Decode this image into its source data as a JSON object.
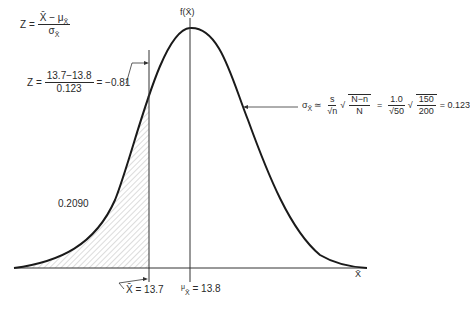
{
  "figure": {
    "type": "normal-distribution-diagram",
    "y_axis_label": "f(X̄)",
    "x_axis_label": "X̄",
    "shaded_area_value": "0.2090",
    "colors": {
      "curve": "#1a1a1a",
      "hatch": "#9a9a9a",
      "text": "#2a2a2a"
    }
  },
  "formulas": {
    "z_general": {
      "lhs": "Z =",
      "numerator": "X̄ − μ",
      "numerator_sub": "X̄",
      "denominator": "σ",
      "denominator_sub": "X̄"
    },
    "z_computed": {
      "lhs": "Z =",
      "numerator": "13.7−13.8",
      "denominator": "0.123",
      "result": "= −0.81"
    },
    "sigma": {
      "lhs": "σ",
      "lhs_sub": "X̄",
      "approx": "≃",
      "frac1_num": "s",
      "frac1_den": "√n",
      "sqrt_num": "N−n",
      "sqrt_den": "N",
      "eq": "=",
      "frac2_num": "1.0",
      "frac2_den": "√50",
      "sqrt2_num": "150",
      "sqrt2_den": "200",
      "result": "= 0.123"
    }
  },
  "markers": {
    "x_bar": "X̄ = 13.7",
    "mu_symbol": "μ",
    "mu_sub": "X̄",
    "mu_value": "= 13.8"
  }
}
